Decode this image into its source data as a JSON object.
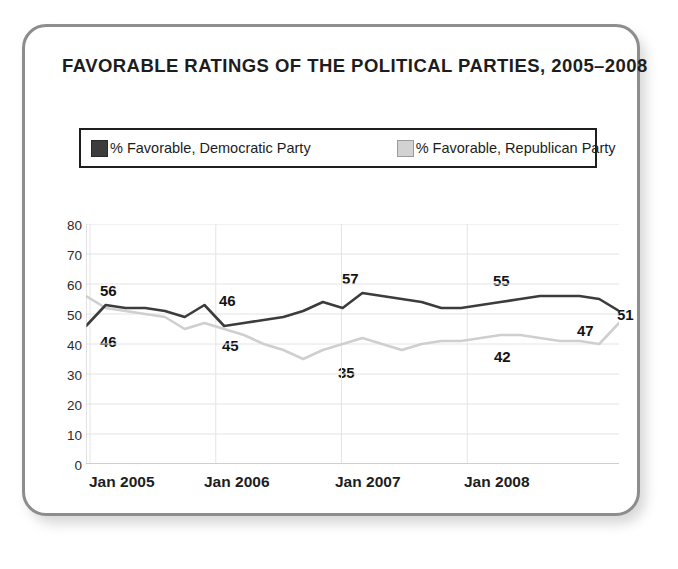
{
  "chart_data": {
    "type": "line",
    "title": "FAVORABLE RATINGS OF THE POLITICAL PARTIES, 2005–2008",
    "xlabel": "",
    "ylabel": "",
    "ylim": [
      0,
      80
    ],
    "yticks": [
      0,
      10,
      20,
      30,
      40,
      50,
      60,
      70,
      80
    ],
    "xtick_labels": [
      "Jan 2005",
      "Jan 2006",
      "Jan 2007",
      "Jan 2008"
    ],
    "grid": true,
    "legend_position": "top",
    "colors": {
      "democratic": "#3c3c3c",
      "republican": "#cfcfcf",
      "gridline": "#e4e4e8",
      "axis": "#c6c6c6",
      "card_border": "#8d8d8d",
      "text": "#1d1d1d"
    },
    "series": [
      {
        "name": "% Favorable, Democratic Party",
        "color": "#3c3c3c",
        "values": [
          46,
          53,
          52,
          52,
          51,
          49,
          53,
          46,
          47,
          48,
          49,
          51,
          54,
          52,
          57,
          56,
          55,
          54,
          52,
          52,
          53,
          54,
          55,
          56,
          56,
          56,
          55,
          51
        ],
        "labels": [
          {
            "index": 0,
            "value": 46
          },
          {
            "index": 7,
            "value": 46
          },
          {
            "index": 14,
            "value": 57
          },
          {
            "index": 22,
            "value": 55
          },
          {
            "index": 27,
            "value": 51
          }
        ]
      },
      {
        "name": "% Favorable, Republican Party",
        "color": "#cfcfcf",
        "values": [
          56,
          52,
          51,
          50,
          49,
          45,
          47,
          45,
          43,
          40,
          38,
          35,
          38,
          40,
          42,
          40,
          38,
          40,
          41,
          41,
          42,
          43,
          43,
          42,
          41,
          41,
          40,
          47
        ],
        "labels": [
          {
            "index": 0,
            "value": 56
          },
          {
            "index": 5,
            "value": 45
          },
          {
            "index": 11,
            "value": 35
          },
          {
            "index": 20,
            "value": 42
          },
          {
            "index": 27,
            "value": 47
          }
        ]
      }
    ]
  },
  "legend": {
    "entries": [
      {
        "label": "% Favorable, Democratic Party",
        "swatch": "dark-gray-swatch"
      },
      {
        "label": "% Favorable, Republican Party",
        "swatch": "light-gray-swatch"
      }
    ]
  },
  "annotations": {
    "dem_start": "46",
    "dem_2006_low": "46",
    "dem_peak": "57",
    "dem_2008": "55",
    "dem_end": "51",
    "rep_start": "56",
    "rep_2006": "45",
    "rep_low": "35",
    "rep_2008": "42",
    "rep_end": "47"
  },
  "axis": {
    "y": [
      "80",
      "70",
      "60",
      "50",
      "40",
      "30",
      "20",
      "10",
      "0"
    ],
    "x": [
      "Jan 2005",
      "Jan 2006",
      "Jan 2007",
      "Jan 2008"
    ]
  }
}
